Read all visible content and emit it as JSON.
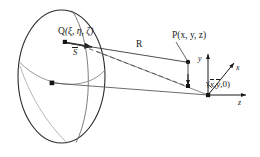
{
  "figure": {
    "background": "#ffffff",
    "ink": "#1a1a1a",
    "grid_color": "#9a9a9a",
    "width": 260,
    "height": 157
  },
  "labels": {
    "source_point": "Q",
    "source_coords": "(ξ, η, ζ)",
    "source_vector": "S",
    "distance": "R",
    "field_point": "P",
    "field_coords": "(x, y, z)",
    "ground_point_coords_open": "(",
    "ground_x": "x",
    "ground_y": "y",
    "ground_z": "0",
    "ground_point_coords_close": ")",
    "axis_x": "x",
    "axis_y": "y",
    "axis_z": "z"
  },
  "geometry": {
    "sphere": {
      "cx": 61.5,
      "cy": 76.5,
      "rx": 43.5,
      "ry": 66.5,
      "center_dot": {
        "x": 52,
        "y": 83
      }
    },
    "points": {
      "Q": {
        "x": 65,
        "y": 42
      },
      "S_arrow_tip": {
        "x": 94,
        "y": 47
      },
      "P": {
        "x": 188,
        "y": 62
      },
      "ground_projection": {
        "x": 188,
        "y": 86
      },
      "origin": {
        "x": 208,
        "y": 95
      }
    },
    "axes": {
      "y_tip": {
        "x": 208,
        "y": 52
      },
      "x_tip": {
        "x": 235,
        "y": 62
      },
      "z_tip": {
        "x": 247,
        "y": 95
      }
    },
    "lines": {
      "R_solid": "Q to P",
      "dashed": "Q to ground projection",
      "horizon": "sphere center to origin"
    }
  }
}
